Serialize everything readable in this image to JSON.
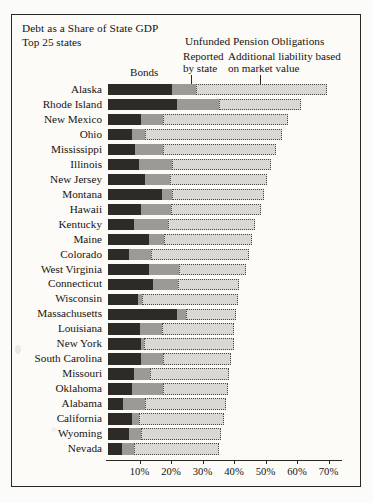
{
  "chart_data": {
    "type": "bar",
    "orientation": "horizontal",
    "stacked": true,
    "title": "Debt as a Share of State GDP",
    "subtitle": "Top 25 states",
    "group_header": "Unfunded Pension Obligations",
    "xlabel": "",
    "ylabel": "",
    "xlim": [
      0,
      75
    ],
    "xticks": [
      10,
      20,
      30,
      40,
      50,
      60,
      70
    ],
    "xticklabels": [
      "10%",
      "20%",
      "30%",
      "40%",
      "50%",
      "60%",
      "70%"
    ],
    "grid": false,
    "legend_position": "top",
    "legend": [
      {
        "name": "Bonds",
        "color": "#2e2a26"
      },
      {
        "name": "Reported by state",
        "color": "#9b9a96"
      },
      {
        "name": "Additional liability based on market value",
        "color": "#d9d8d3"
      }
    ],
    "series": [
      {
        "name": "Bonds",
        "key": "bonds"
      },
      {
        "name": "Reported by state",
        "key": "reported"
      },
      {
        "name": "Additional liability based on market value",
        "key": "market"
      }
    ],
    "categories": [
      "Alaska",
      "Rhode Island",
      "New Mexico",
      "Ohio",
      "Mississippi",
      "Illinois",
      "New Jersey",
      "Montana",
      "Hawaii",
      "Kentucky",
      "Maine",
      "Colorado",
      "West Virginia",
      "Connecticut",
      "Wisconsin",
      "Massachusetts",
      "Louisiana",
      "New York",
      "South Carolina",
      "Missouri",
      "Oklahoma",
      "Alabama",
      "California",
      "Wyoming",
      "Nevada"
    ],
    "rows": [
      {
        "state": "Alaska",
        "bonds": 20.2,
        "reported": 7.6,
        "market": 41.6,
        "total": 69.4
      },
      {
        "state": "Rhode Island",
        "bonds": 21.8,
        "reported": 13.3,
        "market": 26.3,
        "total": 61.4
      },
      {
        "state": "New Mexico",
        "bonds": 10.6,
        "reported": 7.0,
        "market": 39.4,
        "total": 57.0
      },
      {
        "state": "Ohio",
        "bonds": 7.5,
        "reported": 4.4,
        "market": 43.2,
        "total": 55.1
      },
      {
        "state": "Mississippi",
        "bonds": 8.7,
        "reported": 8.9,
        "market": 35.6,
        "total": 53.2
      },
      {
        "state": "Illinois",
        "bonds": 9.7,
        "reported": 10.5,
        "market": 31.4,
        "total": 51.6
      },
      {
        "state": "New Jersey",
        "bonds": 11.9,
        "reported": 7.9,
        "market": 30.8,
        "total": 50.6
      },
      {
        "state": "Montana",
        "bonds": 17.0,
        "reported": 3.2,
        "market": 29.2,
        "total": 49.4
      },
      {
        "state": "Hawaii",
        "bonds": 10.6,
        "reported": 9.5,
        "market": 28.6,
        "total": 48.7
      },
      {
        "state": "Kentucky",
        "bonds": 8.1,
        "reported": 11.1,
        "market": 27.6,
        "total": 46.8
      },
      {
        "state": "Maine",
        "bonds": 12.9,
        "reported": 4.8,
        "market": 27.9,
        "total": 45.6
      },
      {
        "state": "Colorado",
        "bonds": 6.8,
        "reported": 7.0,
        "market": 31.1,
        "total": 44.9
      },
      {
        "state": "West Virginia",
        "bonds": 12.9,
        "reported": 9.5,
        "market": 21.3,
        "total": 43.7
      },
      {
        "state": "Connecticut",
        "bonds": 14.4,
        "reported": 7.9,
        "market": 19.4,
        "total": 41.7
      },
      {
        "state": "Wisconsin",
        "bonds": 9.4,
        "reported": 1.3,
        "market": 30.5,
        "total": 41.2
      },
      {
        "state": "Massachusetts",
        "bonds": 21.8,
        "reported": 2.9,
        "market": 15.9,
        "total": 40.6
      },
      {
        "state": "Louisiana",
        "bonds": 10.0,
        "reported": 7.0,
        "market": 22.9,
        "total": 39.9
      },
      {
        "state": "New York",
        "bonds": 10.6,
        "reported": 0.7,
        "market": 28.6,
        "total": 39.9
      },
      {
        "state": "South Carolina",
        "bonds": 10.6,
        "reported": 7.0,
        "market": 21.3,
        "total": 38.9
      },
      {
        "state": "Missouri",
        "bonds": 8.1,
        "reported": 5.1,
        "market": 25.1,
        "total": 38.3
      },
      {
        "state": "Oklahoma",
        "bonds": 7.5,
        "reported": 10.1,
        "market": 20.6,
        "total": 38.2
      },
      {
        "state": "Alabama",
        "bonds": 4.9,
        "reported": 7.0,
        "market": 25.7,
        "total": 37.6
      },
      {
        "state": "California",
        "bonds": 7.5,
        "reported": 2.2,
        "market": 27.0,
        "total": 36.7
      },
      {
        "state": "Wyoming",
        "bonds": 6.8,
        "reported": 3.8,
        "market": 25.4,
        "total": 36.0
      },
      {
        "state": "Nevada",
        "bonds": 4.3,
        "reported": 3.8,
        "market": 27.3,
        "total": 35.4
      }
    ]
  }
}
